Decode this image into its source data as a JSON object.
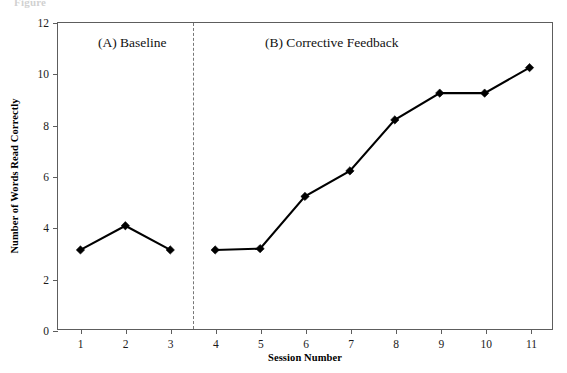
{
  "figure": {
    "caption_fragment": "Figure",
    "annotations": [
      {
        "name": "phase-a",
        "text": "(A) Baseline"
      },
      {
        "name": "phase-b",
        "text": "(B) Corrective Feedback"
      }
    ]
  },
  "chart_data": {
    "type": "line",
    "title": "",
    "xlabel": "Session Number",
    "ylabel": "Number of Words Read Correctly",
    "x": [
      1,
      2,
      3,
      4,
      5,
      6,
      7,
      8,
      9,
      10,
      11
    ],
    "xticklabels": [
      "1",
      "2",
      "3",
      "4",
      "5",
      "6",
      "7",
      "8",
      "9",
      "10",
      "11"
    ],
    "yticks": [
      0,
      2,
      4,
      6,
      8,
      10,
      12
    ],
    "yticklabels": [
      "0",
      "2",
      "4",
      "6",
      "8",
      "10",
      "12"
    ],
    "xlim": [
      0.5,
      11.5
    ],
    "ylim": [
      0,
      12
    ],
    "grid": false,
    "legend": false,
    "marker": "diamond",
    "line_color": "#000000",
    "marker_color": "#000000",
    "series": [
      {
        "name": "Baseline",
        "phase": "A",
        "x": [
          1,
          2,
          3
        ],
        "values": [
          3.1,
          4.05,
          3.1
        ]
      },
      {
        "name": "Corrective Feedback",
        "phase": "B",
        "x": [
          4,
          5,
          6,
          7,
          8,
          9,
          10,
          11
        ],
        "values": [
          3.1,
          3.15,
          5.2,
          6.2,
          8.2,
          9.25,
          9.25,
          10.25
        ]
      }
    ],
    "phase_change_line": {
      "x": 3.5,
      "style": "dashed",
      "color": "#777777"
    },
    "annotations": [
      {
        "text": "(A) Baseline",
        "x": 1.4,
        "y": 11.3
      },
      {
        "text": "(B) Corrective Feedback",
        "x": 5.3,
        "y": 11.3
      }
    ]
  }
}
